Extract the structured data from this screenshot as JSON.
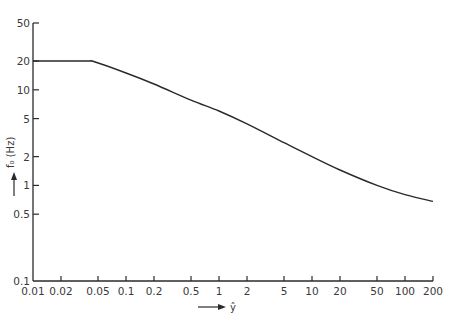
{
  "chart_data": {
    "type": "line",
    "title": "",
    "xlabel": "ŷ",
    "ylabel": "f₀ (Hz)",
    "xscale": "log",
    "yscale": "log",
    "xlim": [
      0.01,
      200
    ],
    "ylim": [
      0.1,
      50
    ],
    "grid": false,
    "legend": null,
    "x_ticks": [
      "0.01",
      "0.02",
      "0.05",
      "0.1",
      "0.2",
      "0.5",
      "1",
      "2",
      "5",
      "10",
      "20",
      "50",
      "100",
      "200"
    ],
    "y_ticks": [
      "0.1",
      "0.5",
      "1",
      "2",
      "5",
      "10",
      "20",
      "50"
    ],
    "series": [
      {
        "name": "f0",
        "x": [
          0.01,
          0.02,
          0.04,
          0.045,
          0.1,
          0.2,
          0.5,
          1,
          2,
          5,
          10,
          20,
          50,
          100,
          200
        ],
        "y": [
          20,
          20,
          20,
          19.8,
          15,
          11.5,
          7.8,
          6.0,
          4.4,
          2.8,
          2.0,
          1.45,
          1.0,
          0.8,
          0.68
        ]
      }
    ]
  },
  "axes": {
    "xlabel_text": "ŷ",
    "ylabel_text": "f₀ (Hz)"
  }
}
